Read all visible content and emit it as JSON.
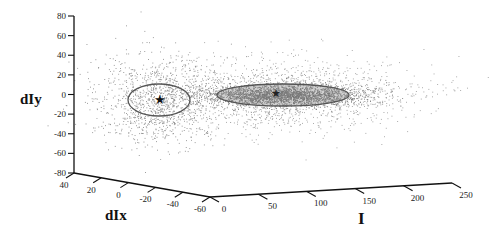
{
  "chart_data": {
    "type": "scatter",
    "projection": "3d",
    "title": "",
    "axes": {
      "x": {
        "label": "I",
        "ticks": [
          "0",
          "50",
          "100",
          "150",
          "200",
          "250"
        ],
        "range": [
          0,
          250
        ]
      },
      "y": {
        "label": "dIx",
        "ticks": [
          "40",
          "20",
          "0",
          "-20",
          "-40",
          "-60"
        ],
        "range": [
          -60,
          40
        ]
      },
      "z": {
        "label": "dIy",
        "ticks": [
          "80",
          "60",
          "40",
          "20",
          "0",
          "-20",
          "-40",
          "-60",
          "-80"
        ],
        "range": [
          -80,
          80
        ]
      }
    },
    "grid": false,
    "legend": null,
    "clusters": [
      {
        "name": "cluster-1",
        "center_marker": "star",
        "center": {
          "I": 0,
          "dIx": 0,
          "dIy": 0
        },
        "ellipse": "wide circular-ish, covers dIy approx -15..15",
        "point_density": "sparse"
      },
      {
        "name": "cluster-2",
        "center_marker": "star",
        "center": {
          "I": 110,
          "dIx": 0,
          "dIy": 0
        },
        "ellipse": "elongated along I, approx I 10..230, thin in dIy",
        "point_density": "dense"
      }
    ],
    "series": [
      {
        "name": "points",
        "color": "#8a8a8a",
        "marker": "dot"
      },
      {
        "name": "ellipses",
        "color": "#555555",
        "marker": "line"
      },
      {
        "name": "centers",
        "color": "#111111",
        "marker": "star"
      }
    ]
  }
}
